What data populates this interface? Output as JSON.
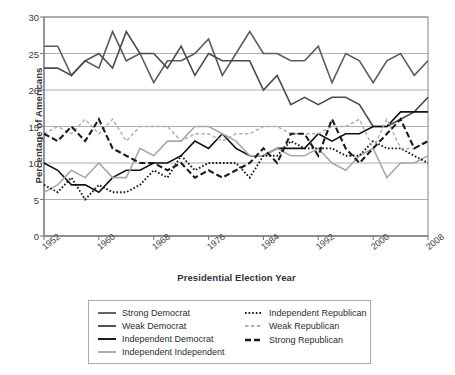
{
  "chart_data": {
    "type": "line",
    "title": "",
    "xlabel": "Presidential Election Year",
    "ylabel": "Percentage of Americans",
    "xlim": [
      1952,
      2008
    ],
    "ylim": [
      0,
      30
    ],
    "yticks": [
      0,
      5,
      10,
      15,
      20,
      25,
      30
    ],
    "xticks": [
      1952,
      1960,
      1968,
      1976,
      1984,
      1992,
      2000,
      2008
    ],
    "grid": "horizontal",
    "legend_position": "bottom",
    "x": [
      1952,
      1954,
      1956,
      1958,
      1960,
      1962,
      1964,
      1966,
      1968,
      1970,
      1972,
      1974,
      1976,
      1978,
      1980,
      1982,
      1984,
      1986,
      1988,
      1990,
      1992,
      1994,
      1996,
      1998,
      2000,
      2002,
      2004,
      2006,
      2008
    ],
    "series": [
      {
        "name": "Strong Democrat",
        "color": "#5b5b66",
        "style": "solid",
        "values": [
          26,
          26,
          22,
          24,
          23,
          28,
          24,
          25,
          21,
          24,
          24,
          25,
          27,
          22,
          25,
          28,
          25,
          25,
          24,
          24,
          26,
          21,
          25,
          24,
          21,
          24,
          25,
          22,
          24
        ]
      },
      {
        "name": "Weak Democrat",
        "color": "#4a4a55",
        "style": "solid",
        "values": [
          23,
          23,
          22,
          24,
          25,
          23,
          28,
          25,
          25,
          23,
          26,
          22,
          25,
          24,
          24,
          24,
          20,
          22,
          18,
          19,
          18,
          19,
          19,
          18,
          15,
          15,
          16,
          17,
          19
        ]
      },
      {
        "name": "Independent Democrat",
        "color": "#111118",
        "style": "solid",
        "values": [
          10,
          9,
          7,
          7,
          6,
          8,
          9,
          9,
          10,
          10,
          11,
          13,
          12,
          14,
          12,
          11,
          11,
          12,
          12,
          12,
          14,
          13,
          14,
          14,
          15,
          15,
          17,
          17,
          17
        ]
      },
      {
        "name": "Independent Independent",
        "color": "#a8a8b0",
        "style": "solid",
        "values": [
          6,
          7,
          9,
          8,
          10,
          8,
          8,
          12,
          11,
          13,
          13,
          15,
          15,
          14,
          13,
          11,
          11,
          12,
          11,
          11,
          12,
          10,
          9,
          11,
          12,
          8,
          10,
          10,
          11
        ]
      },
      {
        "name": "Independent Republican",
        "color": "#17171d",
        "style": "dotted",
        "values": [
          7,
          6,
          8,
          5,
          7,
          6,
          6,
          7,
          9,
          8,
          11,
          9,
          10,
          10,
          10,
          8,
          11,
          11,
          13,
          12,
          12,
          12,
          11,
          11,
          13,
          12,
          12,
          11,
          10
        ]
      },
      {
        "name": "Weak Republican",
        "color": "#b0b0b8",
        "style": "dashed",
        "values": [
          14,
          15,
          14,
          16,
          14,
          16,
          13,
          15,
          15,
          15,
          13,
          14,
          14,
          13,
          14,
          14,
          15,
          15,
          14,
          14,
          14,
          15,
          15,
          16,
          12,
          16,
          12,
          12,
          13
        ]
      },
      {
        "name": "Strong Republican",
        "color": "#1a1a22",
        "style": "longdash",
        "values": [
          14,
          13,
          15,
          13,
          16,
          12,
          11,
          10,
          10,
          9,
          10,
          8,
          9,
          8,
          9,
          10,
          12,
          10,
          14,
          14,
          11,
          16,
          12,
          10,
          12,
          14,
          16,
          12,
          13
        ]
      }
    ]
  },
  "legend": {
    "left_column": [
      {
        "label": "Strong Democrat",
        "series_index": 0
      },
      {
        "label": "Weak Democrat",
        "series_index": 1
      },
      {
        "label": "Independent Democrat",
        "series_index": 2
      },
      {
        "label": "Independent Independent",
        "series_index": 3
      }
    ],
    "right_column": [
      {
        "label": "Independent Republican",
        "series_index": 4
      },
      {
        "label": "Weak Republican",
        "series_index": 5
      },
      {
        "label": "Strong Republican",
        "series_index": 6
      }
    ]
  },
  "style": {
    "plot_border_color": "#8d8d96",
    "gridline_color": "#9a9aa3",
    "axis_text_color": "#3b3b43",
    "background": "#ffffff"
  }
}
